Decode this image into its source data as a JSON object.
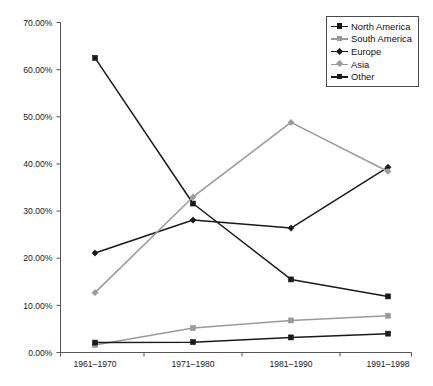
{
  "chart_data": {
    "type": "line",
    "title": "",
    "subtitle": "",
    "xlabel": "",
    "ylabel": "",
    "categories": [
      "1961–1970",
      "1971–1980",
      "1981–1990",
      "1991–1998"
    ],
    "ylim": [
      0,
      70
    ],
    "yticks": [
      0,
      10,
      20,
      30,
      40,
      50,
      60,
      70
    ],
    "ytick_labels": [
      "0.00%",
      "10.00%",
      "20.00%",
      "30.00%",
      "40.00%",
      "50.00%",
      "60.00%",
      "70.00%"
    ],
    "y_unit": "%",
    "grid": false,
    "legend_position": "top-right",
    "series": [
      {
        "name": "North America",
        "values": [
          62.5,
          31.6,
          15.5,
          11.9
        ],
        "color": "#1a1a1a",
        "marker": "square"
      },
      {
        "name": "South America",
        "values": [
          1.6,
          5.2,
          6.8,
          7.8
        ],
        "color": "#9a9a9a",
        "marker": "square"
      },
      {
        "name": "Europe",
        "values": [
          21.1,
          28.1,
          26.4,
          39.3
        ],
        "color": "#1a1a1a",
        "marker": "diamond"
      },
      {
        "name": "Asia",
        "values": [
          12.7,
          33.0,
          48.8,
          38.4
        ],
        "color": "#9a9a9a",
        "marker": "diamond"
      },
      {
        "name": "Other",
        "values": [
          2.1,
          2.2,
          3.2,
          4.0
        ],
        "color": "#1a1a1a",
        "marker": "square"
      }
    ]
  },
  "legend": {
    "items": [
      {
        "label": "North America"
      },
      {
        "label": "South America"
      },
      {
        "label": "Europe"
      },
      {
        "label": "Asia"
      },
      {
        "label": "Other"
      }
    ]
  },
  "axes": {
    "y_axis_name": "percentage-axis",
    "x_axis_name": "period-axis"
  }
}
